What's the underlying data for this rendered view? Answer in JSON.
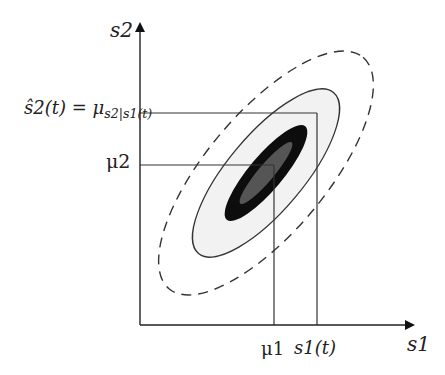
{
  "diagram": {
    "type": "bivariate-gaussian-conditional-mean",
    "axes": {
      "x_label": "s1",
      "y_label": "s2"
    },
    "labels": {
      "y_estimate_lhs": "ŝ2(t) = μ",
      "y_estimate_sub": "s2|s1(t)",
      "y_mean": "μ2",
      "x_mean": "μ1",
      "x_observed": "s1(t)"
    },
    "ellipses": [
      {
        "name": "outer-dashed",
        "rx": 151,
        "ry": 60,
        "fill": "none",
        "stroke": "#333333",
        "dashed": true
      },
      {
        "name": "mid-solid",
        "rx": 105,
        "ry": 38,
        "fill": "#f2f2f2",
        "stroke": "#333333",
        "dashed": false
      },
      {
        "name": "inner-black",
        "rx": 61,
        "ry": 17,
        "fill": "#0d0d0d",
        "stroke": "none",
        "dashed": false
      },
      {
        "name": "core-gray",
        "rx": 40,
        "ry": 8,
        "fill": "#555555",
        "stroke": "none",
        "dashed": false
      }
    ],
    "center": {
      "x": 266,
      "y": 173
    },
    "rotation_deg": -50,
    "guides": {
      "y_estimate_y": 113,
      "y_mean_y": 165,
      "x_mean_x": 274,
      "x_observed_x": 317
    },
    "colors": {
      "line": "#333333",
      "light_fill": "#f2f2f2",
      "dark_fill": "#0d0d0d",
      "core_fill": "#555555"
    }
  }
}
